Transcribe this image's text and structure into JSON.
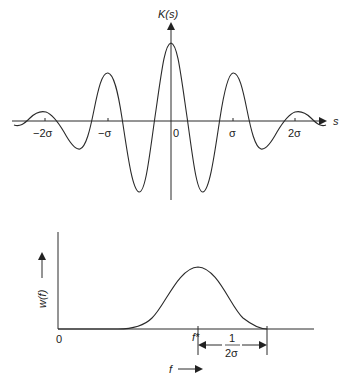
{
  "top_plot": {
    "y_label": "K(s)",
    "x_label": "s",
    "ticks": [
      {
        "label": "−2σ",
        "x": 45
      },
      {
        "label": "−σ",
        "x": 108
      },
      {
        "label": "0",
        "x": 176
      },
      {
        "label": "σ",
        "x": 233
      },
      {
        "label": "2σ",
        "x": 295
      }
    ],
    "description": "Damped oscillating kernel (Gaussian-modulated cosine) centered at 0"
  },
  "bottom_plot": {
    "y_label": "w(f)",
    "x_label": "f",
    "origin_label": "0",
    "peak_label": "f*",
    "width_label_num": "1",
    "width_label_den": "2σ",
    "description": "Gaussian frequency response centered at f*"
  },
  "colors": {
    "line": "#2a2a2a",
    "background": "#ffffff"
  }
}
